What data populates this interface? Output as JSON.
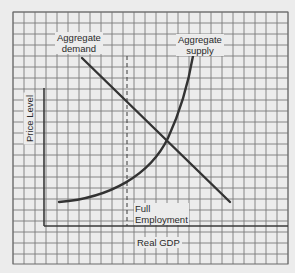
{
  "chart_data": {
    "type": "line",
    "title": "",
    "xlabel": "Real GDP",
    "ylabel": "Price Level",
    "grid": true,
    "axis_ticks": "none (no numeric tick labels shown)",
    "series": [
      {
        "name": "Aggregate demand",
        "shape": "straight downward-sloping line",
        "points_px": [
          [
            82,
            58
          ],
          [
            230,
            202
          ]
        ]
      },
      {
        "name": "Aggregate supply",
        "shape": "upward-sloping convex curve, nearly vertical near top",
        "points_px": [
          [
            59,
            202
          ],
          [
            100,
            196
          ],
          [
            127,
            184
          ],
          [
            150,
            164
          ],
          [
            166,
            141
          ],
          [
            180,
            110
          ],
          [
            188,
            85
          ],
          [
            193,
            56
          ]
        ]
      }
    ],
    "reference_lines": [
      {
        "type": "vertical-dashed",
        "label": "Full Employment",
        "x_px": 127,
        "y_range_px": [
          56,
          226
        ]
      }
    ],
    "intersection_px": [
      166,
      141
    ],
    "annotations": [
      "Aggregate demand",
      "Aggregate supply",
      "Full Employment"
    ]
  },
  "labels": {
    "ad_line1": "Aggregate",
    "ad_line2": "demand",
    "as_line1": "Aggregate",
    "as_line2": "supply",
    "fe_line1": "Full",
    "fe_line2": "Employment",
    "xaxis": "Real GDP",
    "yaxis": "Price Level"
  },
  "colors": {
    "background": "#ececec",
    "grid": "#6e6e6e",
    "curve": "#3a3a3a",
    "text": "#2a2a2a"
  }
}
